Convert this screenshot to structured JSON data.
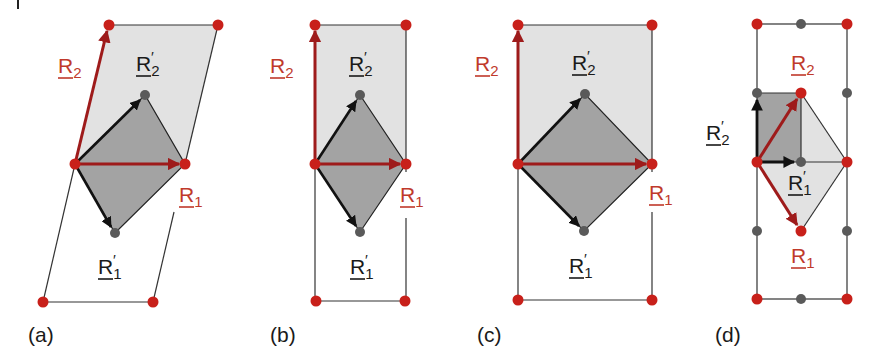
{
  "figure": {
    "colors": {
      "lattice_point_red": "#c8201a",
      "lattice_point_gray": "#5a5a5a",
      "vector_red": "#9e1b1b",
      "vector_black": "#111111",
      "cell_light_fill": "#e2e2e2",
      "cell_dark_fill": "#a3a3a3",
      "edge_line": "#333333"
    },
    "panels": [
      {
        "id": "a",
        "label": "(a)",
        "vectors": {
          "R1": {
            "text": "R",
            "sub": "1",
            "prime": false
          },
          "R2": {
            "text": "R",
            "sub": "2",
            "prime": false
          },
          "R1p": {
            "text": "R",
            "sub": "1",
            "prime": true
          },
          "R2p": {
            "text": "R",
            "sub": "2",
            "prime": true
          }
        }
      },
      {
        "id": "b",
        "label": "(b)",
        "vectors": {
          "R1": {
            "text": "R",
            "sub": "1",
            "prime": false
          },
          "R2": {
            "text": "R",
            "sub": "2",
            "prime": false
          },
          "R1p": {
            "text": "R",
            "sub": "1",
            "prime": true
          },
          "R2p": {
            "text": "R",
            "sub": "2",
            "prime": true
          }
        }
      },
      {
        "id": "c",
        "label": "(c)",
        "vectors": {
          "R1": {
            "text": "R",
            "sub": "1",
            "prime": false
          },
          "R2": {
            "text": "R",
            "sub": "2",
            "prime": false
          },
          "R1p": {
            "text": "R",
            "sub": "1",
            "prime": true
          },
          "R2p": {
            "text": "R",
            "sub": "2",
            "prime": true
          }
        }
      },
      {
        "id": "d",
        "label": "(d)",
        "vectors": {
          "R1": {
            "text": "R",
            "sub": "1",
            "prime": false
          },
          "R2": {
            "text": "R",
            "sub": "2",
            "prime": false
          },
          "R1p": {
            "text": "R",
            "sub": "1",
            "prime": true
          },
          "R2p": {
            "text": "R",
            "sub": "2",
            "prime": true
          }
        }
      }
    ],
    "prime_mark": "′"
  }
}
